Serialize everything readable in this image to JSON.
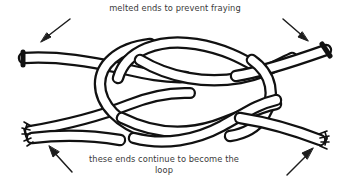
{
  "figure": {
    "background_color": "#ffffff",
    "ink_color": "#111111",
    "text_color": "#3a3a3a"
  },
  "annotations": {
    "top_caption": "melted ends to prevent fraying",
    "bottom_caption": "these ends continue to become the\nloop"
  },
  "arrows": [
    {
      "name": "arrow-top-left",
      "direction": "down-left",
      "points_to": "upper-left melted rope end"
    },
    {
      "name": "arrow-top-right",
      "direction": "down-right",
      "points_to": "upper-right melted rope end"
    },
    {
      "name": "arrow-bottom-left",
      "direction": "up-left",
      "points_to": "lower-left frayed rope end"
    },
    {
      "name": "arrow-bottom-right",
      "direction": "up-right",
      "points_to": "lower-right frayed rope end"
    }
  ],
  "rope_ends": [
    {
      "name": "upper-left-end",
      "style": "melted-blunt"
    },
    {
      "name": "upper-right-end",
      "style": "melted-blunt"
    },
    {
      "name": "lower-left-end",
      "style": "frayed"
    },
    {
      "name": "lower-right-end",
      "style": "frayed"
    }
  ]
}
